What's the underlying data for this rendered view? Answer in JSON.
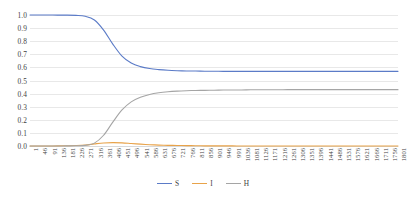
{
  "chart_data": {
    "type": "line",
    "title": "",
    "subtitle": "",
    "xlabel": "",
    "ylabel": "",
    "xlim": [
      1,
      1801
    ],
    "ylim": [
      0.0,
      1.0
    ],
    "grid": true,
    "legend_position": "bottom-center",
    "y_ticks": [
      "1.0",
      "0.9",
      "0.8",
      "0.7",
      "0.6",
      "0.5",
      "0.4",
      "0.3",
      "0.2",
      "0.1",
      "0.0"
    ],
    "y_tick_values": [
      1.0,
      0.9,
      0.8,
      0.7,
      0.6,
      0.5,
      0.4,
      0.3,
      0.2,
      0.1,
      0.0
    ],
    "categories": [
      1,
      46,
      91,
      136,
      181,
      226,
      271,
      316,
      361,
      406,
      451,
      496,
      541,
      586,
      631,
      676,
      721,
      766,
      811,
      856,
      901,
      946,
      991,
      1036,
      1081,
      1126,
      1171,
      1216,
      1261,
      1306,
      1351,
      1396,
      1441,
      1486,
      1531,
      1576,
      1621,
      1666,
      1711,
      1756,
      1801
    ],
    "x_tick_labels": [
      "1",
      "46",
      "91",
      "136",
      "181",
      "226",
      "271",
      "316",
      "361",
      "406",
      "451",
      "496",
      "541",
      "586",
      "631",
      "676",
      "721",
      "766",
      "811",
      "856",
      "901",
      "946",
      "991",
      "1036",
      "1081",
      "1126",
      "1171",
      "1216",
      "1261",
      "1306",
      "1351",
      "1396",
      "1441",
      "1486",
      "1531",
      "1576",
      "1621",
      "1666",
      "1711",
      "1756",
      "1801"
    ],
    "series": [
      {
        "name": "S",
        "color": "#5B7BC7",
        "values": [
          1.0,
          1.0,
          1.0,
          0.999,
          0.999,
          0.997,
          0.99,
          0.962,
          0.885,
          0.778,
          0.686,
          0.633,
          0.606,
          0.591,
          0.583,
          0.578,
          0.575,
          0.573,
          0.572,
          0.571,
          0.571,
          0.57,
          0.57,
          0.57,
          0.57,
          0.57,
          0.57,
          0.57,
          0.57,
          0.57,
          0.57,
          0.57,
          0.57,
          0.57,
          0.57,
          0.57,
          0.57,
          0.57,
          0.57,
          0.57,
          0.57
        ]
      },
      {
        "name": "I",
        "color": "#E8A34A",
        "values": [
          0.0,
          0.0,
          0.0,
          0.001,
          0.002,
          0.004,
          0.008,
          0.016,
          0.023,
          0.026,
          0.024,
          0.019,
          0.014,
          0.01,
          0.007,
          0.005,
          0.004,
          0.003,
          0.002,
          0.001,
          0.001,
          0.001,
          0.001,
          0.0,
          0.0,
          0.0,
          0.0,
          0.0,
          0.0,
          0.0,
          0.0,
          0.0,
          0.0,
          0.0,
          0.0,
          0.0,
          0.0,
          0.0,
          0.0,
          0.0,
          0.0
        ]
      },
      {
        "name": "H",
        "color": "#A5A5A5",
        "values": [
          0.0,
          0.0,
          0.0,
          0.0,
          0.001,
          0.002,
          0.005,
          0.022,
          0.082,
          0.182,
          0.275,
          0.337,
          0.372,
          0.393,
          0.406,
          0.414,
          0.419,
          0.422,
          0.424,
          0.425,
          0.426,
          0.427,
          0.428,
          0.428,
          0.429,
          0.429,
          0.429,
          0.429,
          0.43,
          0.43,
          0.43,
          0.43,
          0.43,
          0.43,
          0.43,
          0.43,
          0.43,
          0.43,
          0.43,
          0.43,
          0.43
        ]
      }
    ]
  },
  "legend": {
    "items": [
      {
        "label": "S",
        "color": "#5B7BC7"
      },
      {
        "label": "I",
        "color": "#E8A34A"
      },
      {
        "label": "H",
        "color": "#A5A5A5"
      }
    ]
  },
  "colors": {
    "gridline": "#e8e8e8",
    "axis_text": "#3f3f3f",
    "background": "#ffffff"
  }
}
